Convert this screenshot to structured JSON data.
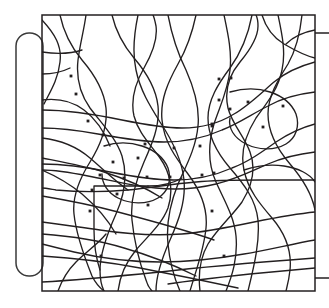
{
  "figure": {
    "type": "line-diagram",
    "width": 329,
    "height": 308,
    "background_color": "#ffffff",
    "ink_color": "#231f20",
    "bracket_color": "#3a3a3a"
  },
  "frame": {
    "name": "bounding-square",
    "x": 42,
    "y": 15,
    "width": 273,
    "height": 276,
    "stroke_width": 1.5
  },
  "bracket": {
    "name": "left-rounded-bracket",
    "x": 16,
    "y": 33,
    "width": 27,
    "height": 243,
    "corner_radius": 13,
    "stroke_width": 1.5
  },
  "stubs": [
    {
      "name": "top-right-stub",
      "x1": 315,
      "y1": 33,
      "x2": 329,
      "y2": 33
    },
    {
      "name": "bottom-right-stub",
      "x1": 315,
      "y1": 278,
      "x2": 329,
      "y2": 278
    }
  ],
  "curves": [
    "M42,20 C55,34 62,46 60,62 C58,80 50,92 44,104",
    "M42,100 C58,98 72,101 84,110 C96,119 104,131 110,146",
    "M42,138 C60,140 76,146 90,158 C104,170 116,182 128,190",
    "M42,158 C62,162 84,166 104,172 C126,179 146,188 162,198",
    "M42,196 C66,200 92,205 118,212 C152,221 186,230 214,240",
    "M42,234 C70,236 98,240 124,248 C152,256 176,266 196,276",
    "M42,256 C74,258 108,262 140,268 C176,275 210,282 238,288",
    "M42,282 C80,280 120,276 160,272 C210,266 262,262 315,258",
    "M60,15 C64,34 72,48 82,60 C94,74 104,90 106,108 C108,128 100,146 90,162 C80,178 72,196 74,214 C76,234 84,256 92,276 C96,284 100,288 104,291",
    "M86,15 C84,30 80,44 78,60 C76,78 80,94 90,108 C102,124 116,138 122,156 C128,176 124,196 116,214 C108,232 100,252 100,270 C100,280 102,287 104,291",
    "M112,15 C116,32 124,46 134,58 C146,72 156,88 158,106 C160,126 152,144 144,162 C136,180 130,200 132,220 C134,240 140,264 146,280 C148,287 150,289 152,291",
    "M138,15 C134,34 132,52 136,70 C140,90 150,106 160,122 C172,140 182,160 184,180 C186,202 178,222 170,240 C162,258 156,276 156,291",
    "M168,15 C172,36 178,54 186,70 C194,88 200,106 198,126 C196,148 186,166 178,184 C170,204 166,224 168,244 C170,266 176,282 180,291",
    "M196,15 C192,34 186,50 178,64 C168,82 160,100 162,120 C164,142 176,158 188,174 C200,190 208,208 206,228 C204,250 196,270 190,291",
    "M224,15 C228,34 232,52 230,70 C228,90 220,106 214,124 C208,144 208,164 216,182 C224,200 234,216 236,236 C238,258 232,276 226,291",
    "M252,15 C248,36 240,54 230,68 C218,84 208,100 208,118 C208,138 218,154 230,168 C244,184 256,200 258,220 C260,242 254,266 248,291",
    "M278,15 C282,34 286,52 282,70 C278,90 266,104 256,118 C246,134 240,152 244,170 C248,190 260,204 272,218 C284,232 292,250 290,270 C289,280 287,287 286,291",
    "M302,15 C300,34 296,50 288,64 C278,80 268,96 268,114 C268,134 278,150 290,164 C302,178 312,194 315,210",
    "M315,62 C300,66 286,72 274,82 C260,94 248,106 234,114 C218,124 200,128 182,128 C162,128 142,124 122,120 C98,115 72,110 42,110",
    "M315,92 C298,94 282,98 268,106 C252,114 238,124 222,130 C204,138 184,142 164,142 C142,142 120,138 98,134 C76,130 58,128 42,128",
    "M315,124 C300,128 288,134 276,142 C262,152 248,162 232,168 C214,176 194,180 174,180 C152,180 130,176 110,172 C86,167 64,164 42,164",
    "M315,152 C298,154 282,158 268,164 C250,172 234,180 216,184 C196,189 176,190 156,188 C132,186 110,180 88,176 C68,172 54,170 42,170",
    "M315,180 C296,180 278,180 260,180 C238,180 216,180 196,182 C172,184 150,188 128,190 C104,192 78,192 56,190 C50,189 45,188 42,188",
    "M315,212 C294,214 274,218 254,222 C230,227 206,232 182,234 C154,236 126,234 100,230 C78,227 58,224 42,222",
    "M315,240 C292,244 268,250 244,254 C216,259 188,262 160,262 C130,262 100,258 74,252 C62,249 50,246 42,244",
    "M118,291 C120,276 126,262 136,250 C148,236 162,224 168,208 C174,190 170,172 160,158 C150,144 138,132 134,116 C130,98 136,82 144,68 C152,54 158,40 156,26 C155,21 154,17 153,15",
    "M200,291 C198,274 200,258 208,244 C218,228 232,216 242,202 C252,186 256,168 250,152 C244,136 232,124 228,108 C224,90 230,74 240,62 C250,50 258,38 258,26 C258,21 257,17 256,15",
    "M94,205 L94,186 L148,186",
    "M94,205 L94,230 C94,244 96,258 100,270",
    "M148,186 C160,186 172,184 182,178",
    "M42,52 C56,54 70,54 82,50",
    "M42,74 C52,74 62,72 70,68",
    "M262,15 C266,28 274,38 284,44 C296,51 306,56 315,58",
    "M315,30 C304,32 294,36 286,44",
    "M230,92 C244,88 258,88 270,92 C282,96 292,104 296,114 C300,126 296,138 286,144 C274,151 258,150 246,144 C234,138 228,128 230,118",
    "M244,170 C256,166 270,164 284,166 C298,168 310,174 315,182",
    "M104,146 C116,142 130,142 142,146 C154,150 164,158 168,168 C172,180 168,192 158,198 C146,205 130,204 118,198 C108,193 102,184 102,174",
    "M42,170 C56,176 70,184 82,194 C96,206 108,220 116,234",
    "M315,268 C294,270 272,272 250,274 C222,277 194,280 168,284",
    "M58,291 C62,280 68,270 76,262 C86,252 98,244 106,234"
  ],
  "sites": [
    {
      "name": "site-dot",
      "cx": 71,
      "cy": 76
    },
    {
      "name": "site-dot",
      "cx": 76,
      "cy": 94
    },
    {
      "name": "site-dot",
      "cx": 88,
      "cy": 121
    },
    {
      "name": "site-dot",
      "cx": 103,
      "cy": 135
    },
    {
      "name": "site-dot",
      "cx": 145,
      "cy": 144
    },
    {
      "name": "site-dot",
      "cx": 138,
      "cy": 158
    },
    {
      "name": "site-dot",
      "cx": 113,
      "cy": 162
    },
    {
      "name": "site-dot",
      "cx": 100,
      "cy": 175
    },
    {
      "name": "site-dot",
      "cx": 124,
      "cy": 178
    },
    {
      "name": "site-dot",
      "cx": 147,
      "cy": 177
    },
    {
      "name": "site-dot",
      "cx": 92,
      "cy": 190
    },
    {
      "name": "site-dot",
      "cx": 117,
      "cy": 194
    },
    {
      "name": "site-dot",
      "cx": 148,
      "cy": 205
    },
    {
      "name": "site-dot",
      "cx": 90,
      "cy": 211
    },
    {
      "name": "site-dot",
      "cx": 101,
      "cy": 256
    },
    {
      "name": "site-dot",
      "cx": 170,
      "cy": 177
    },
    {
      "name": "site-dot",
      "cx": 174,
      "cy": 148
    },
    {
      "name": "site-dot",
      "cx": 200,
      "cy": 146
    },
    {
      "name": "site-dot",
      "cx": 202,
      "cy": 175
    },
    {
      "name": "site-dot",
      "cx": 212,
      "cy": 126
    },
    {
      "name": "site-dot",
      "cx": 214,
      "cy": 173
    },
    {
      "name": "site-dot",
      "cx": 219,
      "cy": 79
    },
    {
      "name": "site-dot",
      "cx": 231,
      "cy": 78
    },
    {
      "name": "site-dot",
      "cx": 219,
      "cy": 100
    },
    {
      "name": "site-dot",
      "cx": 230,
      "cy": 109
    },
    {
      "name": "site-dot",
      "cx": 212,
      "cy": 124
    },
    {
      "name": "site-dot",
      "cx": 248,
      "cy": 102
    },
    {
      "name": "site-dot",
      "cx": 283,
      "cy": 106
    },
    {
      "name": "site-dot",
      "cx": 212,
      "cy": 211
    },
    {
      "name": "site-dot",
      "cx": 224,
      "cy": 256
    },
    {
      "name": "site-dot",
      "cx": 263,
      "cy": 127
    }
  ]
}
